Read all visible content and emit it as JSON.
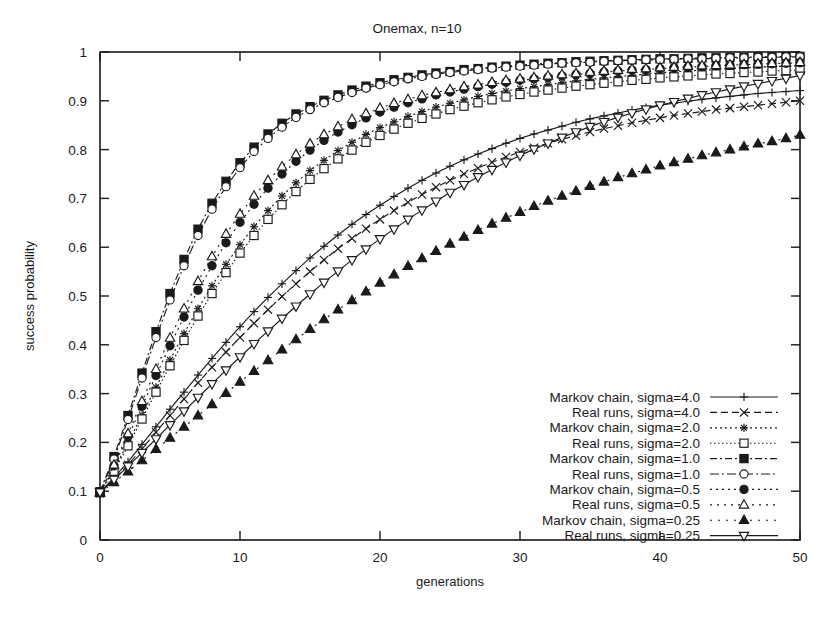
{
  "chart_data": {
    "type": "line",
    "title": "Onemax, n=10",
    "xlabel": "generations",
    "ylabel": "success probability",
    "xlim": [
      0,
      50
    ],
    "ylim": [
      0,
      1
    ],
    "xticks": [
      "0",
      "10",
      "20",
      "30",
      "40",
      "50"
    ],
    "xtick_values": [
      0,
      10,
      20,
      30,
      40,
      50
    ],
    "yticks": [
      "0",
      "0.1",
      "0.2",
      "0.3",
      "0.4",
      "0.5",
      "0.6",
      "0.7",
      "0.8",
      "0.9",
      "1"
    ],
    "ytick_values": [
      0,
      0.1,
      0.2,
      0.3,
      0.4,
      0.5,
      0.6,
      0.7,
      0.8,
      0.9,
      1
    ],
    "grid": false,
    "legend_position": "bottom-right-inside",
    "x": [
      0,
      1,
      2,
      3,
      4,
      5,
      6,
      7,
      8,
      9,
      10,
      11,
      12,
      13,
      14,
      15,
      16,
      17,
      18,
      19,
      20,
      21,
      22,
      23,
      24,
      25,
      26,
      27,
      28,
      29,
      30,
      31,
      32,
      33,
      34,
      35,
      36,
      37,
      38,
      39,
      40,
      41,
      42,
      43,
      44,
      45,
      46,
      47,
      48,
      49,
      50
    ],
    "series": [
      {
        "name": "Markov chain, sigma=4.0",
        "marker": "plus",
        "dash": "solid",
        "values": [
          0.098,
          0.128,
          0.16,
          0.196,
          0.232,
          0.268,
          0.303,
          0.338,
          0.372,
          0.405,
          0.437,
          0.468,
          0.497,
          0.525,
          0.552,
          0.578,
          0.602,
          0.625,
          0.647,
          0.667,
          0.686,
          0.704,
          0.721,
          0.737,
          0.752,
          0.766,
          0.779,
          0.791,
          0.802,
          0.813,
          0.823,
          0.832,
          0.84,
          0.848,
          0.856,
          0.863,
          0.869,
          0.875,
          0.881,
          0.886,
          0.891,
          0.895,
          0.899,
          0.903,
          0.906,
          0.909,
          0.912,
          0.915,
          0.917,
          0.919,
          0.921
        ]
      },
      {
        "name": "Real runs, sigma=4.0",
        "marker": "cross",
        "dash": "dashed",
        "values": [
          0.096,
          0.124,
          0.154,
          0.187,
          0.221,
          0.255,
          0.289,
          0.322,
          0.354,
          0.385,
          0.415,
          0.444,
          0.472,
          0.499,
          0.525,
          0.55,
          0.574,
          0.597,
          0.618,
          0.638,
          0.657,
          0.675,
          0.692,
          0.708,
          0.723,
          0.737,
          0.75,
          0.762,
          0.774,
          0.785,
          0.795,
          0.804,
          0.813,
          0.821,
          0.829,
          0.836,
          0.843,
          0.849,
          0.855,
          0.86,
          0.865,
          0.87,
          0.874,
          0.878,
          0.882,
          0.885,
          0.888,
          0.891,
          0.894,
          0.897,
          0.9
        ]
      },
      {
        "name": "Markov chain, sigma=2.0",
        "marker": "star",
        "dash": "dotted",
        "values": [
          0.098,
          0.145,
          0.199,
          0.256,
          0.313,
          0.369,
          0.423,
          0.474,
          0.521,
          0.565,
          0.605,
          0.642,
          0.675,
          0.705,
          0.732,
          0.757,
          0.778,
          0.798,
          0.815,
          0.831,
          0.845,
          0.857,
          0.868,
          0.878,
          0.887,
          0.895,
          0.902,
          0.909,
          0.915,
          0.92,
          0.925,
          0.929,
          0.933,
          0.937,
          0.941,
          0.944,
          0.947,
          0.95,
          0.952,
          0.955,
          0.957,
          0.959,
          0.961,
          0.963,
          0.964,
          0.966,
          0.967,
          0.969,
          0.97,
          0.971,
          0.972
        ]
      },
      {
        "name": "Real runs, sigma=2.0",
        "marker": "square-open",
        "dash": "fine-dotted",
        "values": [
          0.097,
          0.141,
          0.193,
          0.248,
          0.303,
          0.357,
          0.409,
          0.459,
          0.505,
          0.548,
          0.588,
          0.624,
          0.657,
          0.687,
          0.714,
          0.739,
          0.761,
          0.781,
          0.799,
          0.815,
          0.829,
          0.842,
          0.854,
          0.864,
          0.873,
          0.882,
          0.889,
          0.896,
          0.902,
          0.908,
          0.913,
          0.918,
          0.922,
          0.926,
          0.93,
          0.933,
          0.936,
          0.939,
          0.942,
          0.944,
          0.947,
          0.949,
          0.951,
          0.953,
          0.955,
          0.956,
          0.958,
          0.959,
          0.961,
          0.962,
          0.963
        ]
      },
      {
        "name": "Markov chain, sigma=1.0",
        "marker": "square-filled",
        "dash": "dashdot",
        "values": [
          0.099,
          0.171,
          0.255,
          0.342,
          0.427,
          0.505,
          0.575,
          0.637,
          0.69,
          0.735,
          0.773,
          0.805,
          0.832,
          0.854,
          0.873,
          0.888,
          0.901,
          0.912,
          0.922,
          0.93,
          0.937,
          0.943,
          0.948,
          0.953,
          0.957,
          0.96,
          0.964,
          0.966,
          0.969,
          0.971,
          0.973,
          0.975,
          0.977,
          0.978,
          0.98,
          0.981,
          0.982,
          0.983,
          0.984,
          0.985,
          0.986,
          0.986,
          0.987,
          0.988,
          0.988,
          0.989,
          0.989,
          0.99,
          0.99,
          0.991,
          0.991
        ]
      },
      {
        "name": "Real runs, sigma=1.0",
        "marker": "circle-open",
        "dash": "dashdot-long",
        "values": [
          0.097,
          0.166,
          0.247,
          0.332,
          0.415,
          0.492,
          0.562,
          0.624,
          0.678,
          0.724,
          0.763,
          0.796,
          0.823,
          0.846,
          0.866,
          0.882,
          0.896,
          0.907,
          0.917,
          0.926,
          0.933,
          0.939,
          0.945,
          0.95,
          0.954,
          0.958,
          0.961,
          0.964,
          0.967,
          0.969,
          0.971,
          0.973,
          0.975,
          0.977,
          0.978,
          0.979,
          0.981,
          0.982,
          0.983,
          0.984,
          0.984,
          0.985,
          0.986,
          0.986,
          0.987,
          0.988,
          0.988,
          0.989,
          0.989,
          0.99,
          0.99
        ]
      },
      {
        "name": "Markov chain, sigma=0.5",
        "marker": "circle-filled",
        "dash": "dotted-gap",
        "values": [
          0.098,
          0.152,
          0.212,
          0.274,
          0.337,
          0.398,
          0.457,
          0.512,
          0.562,
          0.609,
          0.651,
          0.688,
          0.721,
          0.75,
          0.776,
          0.799,
          0.819,
          0.836,
          0.851,
          0.865,
          0.877,
          0.887,
          0.896,
          0.904,
          0.912,
          0.918,
          0.924,
          0.929,
          0.934,
          0.938,
          0.942,
          0.945,
          0.948,
          0.951,
          0.954,
          0.956,
          0.959,
          0.961,
          0.963,
          0.964,
          0.966,
          0.968,
          0.969,
          0.97,
          0.972,
          0.973,
          0.974,
          0.975,
          0.976,
          0.977,
          0.978
        ]
      },
      {
        "name": "Real runs, sigma=0.5",
        "marker": "triangle-open",
        "dash": "dotted-wide",
        "values": [
          0.097,
          0.154,
          0.218,
          0.284,
          0.35,
          0.414,
          0.474,
          0.53,
          0.581,
          0.627,
          0.668,
          0.705,
          0.737,
          0.765,
          0.79,
          0.812,
          0.831,
          0.847,
          0.862,
          0.874,
          0.885,
          0.895,
          0.903,
          0.911,
          0.917,
          0.923,
          0.929,
          0.933,
          0.938,
          0.942,
          0.945,
          0.948,
          0.951,
          0.954,
          0.956,
          0.959,
          0.961,
          0.963,
          0.965,
          0.966,
          0.968,
          0.969,
          0.971,
          0.972,
          0.973,
          0.974,
          0.975,
          0.976,
          0.977,
          0.978,
          0.979
        ]
      },
      {
        "name": "Markov chain, sigma=0.25",
        "marker": "triangle-filled",
        "dash": "dotted-sparse",
        "values": [
          0.097,
          0.118,
          0.14,
          0.163,
          0.186,
          0.209,
          0.232,
          0.255,
          0.278,
          0.301,
          0.324,
          0.346,
          0.368,
          0.39,
          0.411,
          0.432,
          0.452,
          0.472,
          0.491,
          0.509,
          0.527,
          0.544,
          0.561,
          0.577,
          0.592,
          0.607,
          0.621,
          0.635,
          0.648,
          0.66,
          0.672,
          0.684,
          0.695,
          0.705,
          0.715,
          0.725,
          0.734,
          0.743,
          0.751,
          0.759,
          0.767,
          0.774,
          0.781,
          0.788,
          0.794,
          0.8,
          0.806,
          0.812,
          0.817,
          0.823,
          0.83
        ]
      },
      {
        "name": "Real runs, sigma=0.25",
        "marker": "triangle-down-open",
        "dash": "solid",
        "values": [
          0.098,
          0.124,
          0.151,
          0.179,
          0.207,
          0.236,
          0.264,
          0.292,
          0.32,
          0.348,
          0.375,
          0.402,
          0.428,
          0.454,
          0.479,
          0.504,
          0.528,
          0.551,
          0.574,
          0.596,
          0.617,
          0.637,
          0.657,
          0.676,
          0.694,
          0.712,
          0.728,
          0.744,
          0.759,
          0.774,
          0.788,
          0.801,
          0.813,
          0.825,
          0.836,
          0.847,
          0.857,
          0.866,
          0.875,
          0.883,
          0.891,
          0.898,
          0.905,
          0.912,
          0.918,
          0.924,
          0.93,
          0.935,
          0.941,
          0.946,
          0.952
        ]
      }
    ]
  }
}
